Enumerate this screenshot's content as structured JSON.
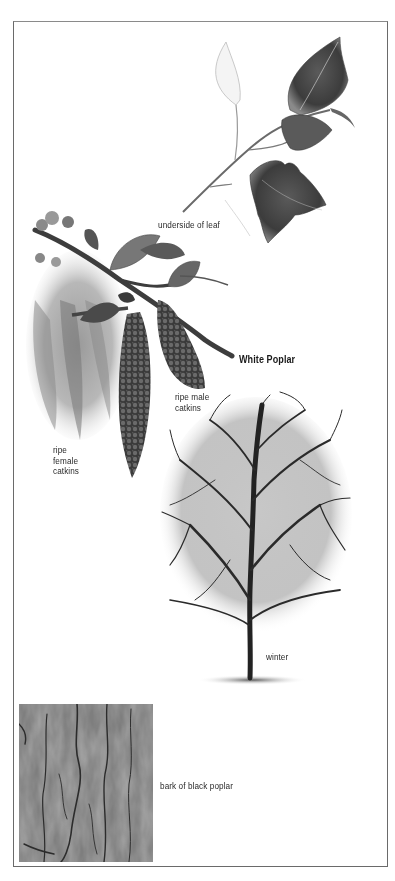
{
  "page": {
    "background": "#ffffff",
    "frame_color": "#6a6a6a"
  },
  "illustrations": {
    "leaf_sprig": {
      "icon": "poplar-leaf-sprig-illustration"
    },
    "catkin_branch": {
      "icon": "catkin-branch-illustration"
    },
    "winter_tree": {
      "icon": "winter-tree-illustration"
    },
    "bark_photo": {
      "icon": "bark-texture-photo"
    }
  },
  "labels": {
    "underside_of_leaf": "underside of leaf",
    "species_title": "White Poplar",
    "ripe_male_catkins": [
      "ripe male",
      "catkins"
    ],
    "ripe_female_catkins": [
      "ripe",
      "female",
      "catkins"
    ],
    "winter": "winter",
    "bark_caption": "bark of black poplar"
  }
}
